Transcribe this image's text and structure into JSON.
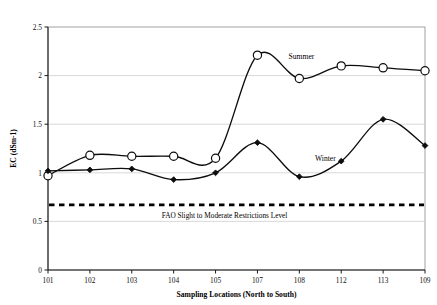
{
  "chart_data": {
    "type": "line",
    "title": "",
    "xlabel": "Sampling Locations (North to South)",
    "ylabel": "EC (dSm-1)",
    "categories": [
      "101",
      "102",
      "103",
      "104",
      "105",
      "107",
      "108",
      "112",
      "113",
      "109"
    ],
    "ylim": [
      0,
      2.5
    ],
    "yticks": [
      "0",
      "0.5",
      "1",
      "1.5",
      "2",
      "2.5"
    ],
    "ytick_values": [
      0,
      0.5,
      1,
      1.5,
      2,
      2.5
    ],
    "grid": "horizontal",
    "legend_position": "inline-annotations",
    "series": [
      {
        "name": "Summer",
        "marker": "open-circle",
        "values": [
          0.97,
          1.18,
          1.17,
          1.17,
          1.15,
          2.21,
          1.97,
          2.1,
          2.08,
          2.05
        ]
      },
      {
        "name": "Winter",
        "marker": "filled-diamond",
        "values": [
          1.02,
          1.03,
          1.04,
          0.93,
          1.0,
          1.31,
          0.96,
          1.12,
          1.55,
          1.28
        ]
      }
    ],
    "annotations": [
      {
        "name": "fao-threshold",
        "label": "FAO Slight to Moderate Restrictions Level",
        "value": 0.67,
        "style": "dashed-horizontal-line"
      }
    ]
  },
  "labels": {
    "summer": "Summer",
    "winter": "Winter"
  }
}
